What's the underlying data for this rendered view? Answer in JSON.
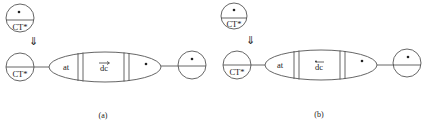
{
  "figure": {
    "panels": [
      {
        "id": "a",
        "caption": "(a)",
        "top_node": {
          "label": "CT*",
          "marker": "•"
        },
        "transition_arrow": "⇓",
        "left_node": {
          "label": "CT*"
        },
        "chain": {
          "segments": [
            {
              "label": "at"
            },
            {
              "label": "dc",
              "decoration": "arrow-over"
            },
            {
              "label": "•"
            }
          ]
        },
        "right_node": {
          "marker": "•"
        }
      },
      {
        "id": "b",
        "caption": "(b)",
        "top_node": {
          "label": "CT*",
          "marker": "•"
        },
        "transition_arrow": "⇓",
        "left_node": {
          "label": "CT*"
        },
        "chain": {
          "segments": [
            {
              "label": "at"
            },
            {
              "label": "dc",
              "decoration": "dot-over"
            },
            {
              "label": "•"
            }
          ]
        },
        "right_node": {
          "marker": "•"
        }
      }
    ]
  }
}
